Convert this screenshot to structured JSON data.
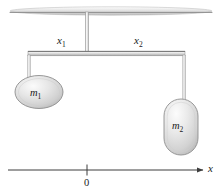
{
  "diagram": {
    "type": "physics-free-body-diagram",
    "labels": {
      "x1": "x",
      "x1_sub": "1",
      "x2": "x",
      "x2_sub": "2",
      "m1": "m",
      "m1_sub": "1",
      "m2": "m",
      "m2_sub": "2",
      "origin": "0",
      "axis": "x"
    },
    "colors": {
      "stroke": "#5a5a5a",
      "dark_stroke": "#3d3d3d",
      "text": "#1a1a1a",
      "fill_light": "#f2f2f2",
      "fill_mid": "#d8d8d8",
      "fill_dark": "#b8b8b8",
      "background": "#ffffff"
    },
    "elements": {
      "ceiling": {
        "cx": 111,
        "cy": 11,
        "rx": 101,
        "ry": 4
      },
      "support_rod": {
        "x": 87,
        "y_top": 12,
        "y_bottom": 53
      },
      "beam": {
        "x_left": 28,
        "x_right": 185,
        "y": 53,
        "thickness": 5
      },
      "string_left": {
        "x": 29,
        "y_top": 56,
        "y_bottom": 80
      },
      "string_right": {
        "x": 184,
        "y_top": 56,
        "y_bottom": 101
      },
      "mass1": {
        "cx": 39,
        "cy": 92,
        "rx": 24,
        "ry": 16,
        "shape": "ellipse"
      },
      "mass2": {
        "cx": 181,
        "cy": 127,
        "width": 34,
        "height": 56,
        "shape": "stadium"
      },
      "axis": {
        "x_start": 8,
        "x_end": 205,
        "y": 170
      },
      "origin_tick": {
        "x": 87,
        "y_top": 165,
        "y_bottom": 175
      }
    }
  }
}
